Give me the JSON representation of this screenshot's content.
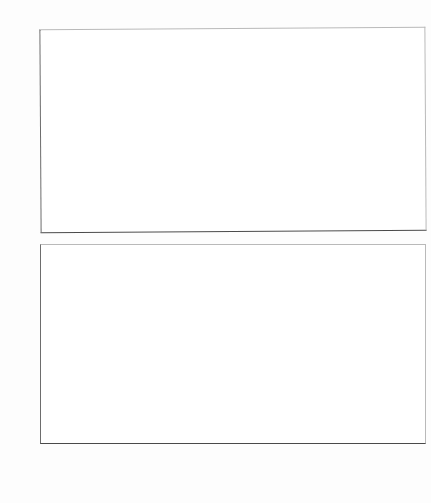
{
  "page": {
    "background_color": "#fdfdfd",
    "bar_fill_color": "#c4c4c4",
    "bar_border_color": "#8d8d8d",
    "axis_color": "#4a4a4a"
  },
  "axis_title": "Number of parcels",
  "chart_data": [
    {
      "type": "bar",
      "id": "top-histogram",
      "title": "Number of parcels",
      "xlabel": "",
      "ylabel": "Number of parcels",
      "ylim": [
        0,
        2075
      ],
      "yticks": [
        500,
        1000,
        1500,
        2000
      ],
      "ytick_labels": [
        "500",
        "1000",
        "1500",
        "2000"
      ],
      "grid": false,
      "legend": null,
      "categories": [
        "0<=X<1",
        "1<=X<2",
        "2<=X<3",
        "3<=X<4",
        "4<=X<5",
        "5<=X<6",
        "6<=X<7",
        "7<=X<8",
        "8<=X<9",
        "9<=X<10",
        "10<=X<11"
      ],
      "values": [
        1320,
        1930,
        780,
        870,
        660,
        250,
        345,
        285,
        105,
        35,
        0
      ]
    },
    {
      "type": "bar",
      "id": "bottom-histogram",
      "title": "",
      "xlabel": "",
      "ylabel": "Number of parcels",
      "ylim": [
        0,
        2075
      ],
      "yticks": [
        0,
        500,
        1000,
        1500,
        2000
      ],
      "ytick_labels": [
        "0",
        "500",
        "1000",
        "1500",
        "2000"
      ],
      "grid": false,
      "legend": null,
      "categories": [
        "0<=X<1",
        "1<=X<2",
        "2<=X<3",
        "3<=X<4",
        "4<=X<5",
        "5<=X<6",
        "6<=X<7",
        "7<=X<8",
        "8<=X<9",
        "9<=X<10",
        "10<=X<11"
      ],
      "values": [
        1320,
        1880,
        930,
        975,
        760,
        405,
        595,
        440,
        135,
        15,
        0
      ]
    }
  ]
}
